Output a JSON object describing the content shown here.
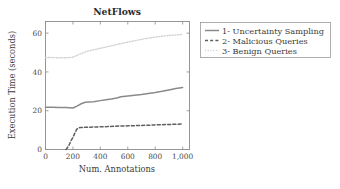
{
  "chart_data": {
    "type": "line",
    "title": "NetFlows",
    "xlabel": "Num. Annotations",
    "ylabel": "Execution Time (seconds)",
    "xlim": [
      0,
      1050
    ],
    "ylim": [
      0,
      66
    ],
    "grid": false,
    "legend_position": "outside-right-top",
    "xticks": [
      0,
      200,
      400,
      600,
      800,
      1000
    ],
    "xtick_labels": [
      "0",
      "200",
      "400",
      "600",
      "800",
      "1,000"
    ],
    "yticks": [
      0,
      20,
      40,
      60
    ],
    "ytick_labels": [
      "0",
      "20",
      "40",
      "60"
    ],
    "series": [
      {
        "name": "1- Uncertainty Sampling",
        "style": "solid",
        "color": "#8a8a8a",
        "x": [
          0,
          50,
          100,
          150,
          200,
          230,
          260,
          290,
          320,
          350,
          400,
          440,
          480,
          520,
          550,
          600,
          650,
          700,
          750,
          800,
          850,
          900,
          950,
          1000
        ],
        "y": [
          21.8,
          21.8,
          21.7,
          21.6,
          21.4,
          22.4,
          23.6,
          24.4,
          24.5,
          24.6,
          25.2,
          25.6,
          26.0,
          26.6,
          27.2,
          27.6,
          28.0,
          28.4,
          28.9,
          29.4,
          30.0,
          30.7,
          31.4,
          32.0
        ]
      },
      {
        "name": "2- Malicious Queries",
        "style": "dashed",
        "color": "#5e5e5e",
        "x": [
          150,
          170,
          185,
          200,
          215,
          230,
          250,
          280,
          320,
          360,
          400,
          450,
          500,
          550,
          600,
          650,
          700,
          750,
          800,
          850,
          900,
          950,
          1000
        ],
        "y": [
          0.0,
          2.0,
          4.4,
          6.2,
          8.6,
          10.6,
          11.3,
          11.4,
          11.5,
          11.6,
          11.7,
          11.8,
          12.0,
          12.1,
          12.2,
          12.3,
          12.4,
          12.5,
          12.7,
          12.8,
          12.9,
          13.0,
          13.2
        ]
      },
      {
        "name": "3- Benign Queries",
        "style": "dotted",
        "color": "#d2d2d2",
        "x": [
          0,
          50,
          100,
          150,
          200,
          250,
          300,
          350,
          400,
          450,
          500,
          550,
          600,
          650,
          700,
          750,
          800,
          850,
          900,
          950,
          1000
        ],
        "y": [
          47.4,
          47.4,
          47.3,
          47.3,
          47.6,
          49.2,
          50.6,
          51.4,
          52.2,
          53.0,
          53.8,
          54.6,
          55.4,
          56.1,
          56.8,
          57.4,
          58.0,
          58.4,
          58.8,
          59.1,
          59.3
        ]
      }
    ]
  },
  "legend": {
    "entries": [
      {
        "label": "1- Uncertainty Sampling",
        "style": "solid"
      },
      {
        "label": "2- Malicious Queries",
        "style": "dashed"
      },
      {
        "label": "3- Benign Queries",
        "style": "dotted"
      }
    ]
  },
  "colors": {
    "axis": "#8c8c8c",
    "text": "#3a3a3a",
    "series_1": "#8a8a8a",
    "series_2": "#5e5e5e",
    "series_3": "#d2d2d2",
    "background": "#ffffff"
  }
}
